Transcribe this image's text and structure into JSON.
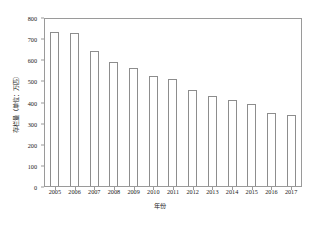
{
  "chart_data": {
    "type": "bar",
    "title": "",
    "xlabel": "年份",
    "ylabel": "存栏量（单位：万匹）",
    "categories": [
      "2005",
      "2006",
      "2007",
      "2008",
      "2009",
      "2010",
      "2011",
      "2012",
      "2013",
      "2014",
      "2015",
      "2016",
      "2017"
    ],
    "values": [
      740,
      733,
      648,
      594,
      563,
      527,
      514,
      462,
      430,
      414,
      393,
      348,
      342
    ],
    "ylim": [
      0,
      800
    ],
    "ytick_labels": [
      "0",
      "100",
      "200",
      "300",
      "400",
      "500",
      "600",
      "700",
      "800"
    ],
    "ytick_values": [
      0,
      100,
      200,
      300,
      400,
      500,
      600,
      700,
      800
    ],
    "grid": false,
    "legend": null,
    "legend_position": "none",
    "bar_fill_color": "#ffffff",
    "bar_edge_color": "#8d8d8d",
    "axis_color": "#9a9a9a",
    "background_color": "#ffffff",
    "text_color": "#1a1a1a"
  }
}
